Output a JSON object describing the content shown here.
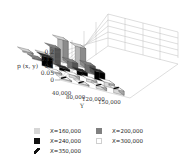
{
  "chart_data": {
    "type": "bar",
    "subtype": "3d-bar",
    "title": "",
    "xlabel": "Y",
    "ylabel": "p (x, y)",
    "zlim": [
      0,
      0.2
    ],
    "z_ticks": [
      "0",
      "0.05",
      "0.1",
      "0.15",
      "0.2"
    ],
    "categories": [
      "40,000",
      "80,000",
      "120,000",
      "150,000"
    ],
    "series": [
      {
        "name": "X=160,000",
        "fill": "#d6d6d6",
        "values": [
          0.01,
          0.02,
          0.16,
          0.14
        ]
      },
      {
        "name": "X=200,000",
        "fill": "#808080",
        "values": [
          0.01,
          0.12,
          0.05,
          0.06
        ]
      },
      {
        "name": "X=240,000",
        "fill": "#111111",
        "values": [
          0.07,
          0.02,
          0.03,
          0.06
        ]
      },
      {
        "name": "X=300,000",
        "fill": "#ffffff",
        "values": [
          0.01,
          0.02,
          0.02,
          0.03
        ]
      },
      {
        "name": "X=350,000",
        "fill": "hatch",
        "values": [
          0.005,
          0.005,
          0.02,
          0.03
        ]
      }
    ],
    "grid": true,
    "legend_position": "bottom"
  },
  "axis": {
    "z_label": "p (x, y)",
    "z_ticks": [
      "0",
      "0.05",
      "0.1",
      "0.15",
      "0.2"
    ],
    "y_label": "Y",
    "y_ticks": [
      "40,000",
      "80,000",
      "120,000",
      "150,000"
    ]
  },
  "legend": [
    {
      "label": "X=160,000",
      "style": "light"
    },
    {
      "label": "X=200,000",
      "style": "mid"
    },
    {
      "label": "X=240,000",
      "style": "black"
    },
    {
      "label": "X=300,000",
      "style": "white"
    },
    {
      "label": "X=350,000",
      "style": "hatch"
    }
  ]
}
